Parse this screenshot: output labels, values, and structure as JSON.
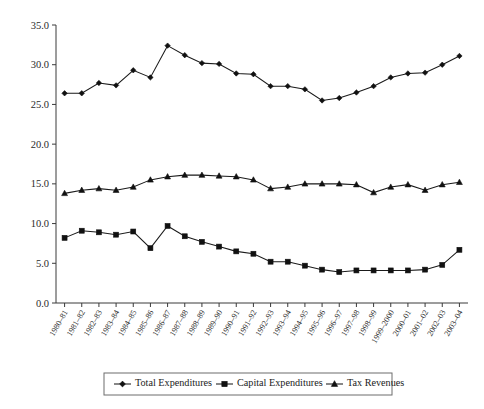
{
  "chart_data": {
    "type": "line",
    "title": "",
    "subtitle": "",
    "xlabel": "",
    "ylabel": "",
    "ylim": [
      0.0,
      35.0
    ],
    "yticks": [
      "0.0",
      "5.0",
      "10.0",
      "15.0",
      "20.0",
      "25.0",
      "30.0",
      "35.0"
    ],
    "ytick_values": [
      0.0,
      5.0,
      10.0,
      15.0,
      20.0,
      25.0,
      30.0,
      35.0
    ],
    "grid": false,
    "legend_position": "bottom",
    "categories": [
      "1980–81",
      "1981–82",
      "1982–83",
      "1983–84",
      "1984–85",
      "1985–86",
      "1986–87",
      "1987–88",
      "1988–89",
      "1989–90",
      "1990–91",
      "1991–92",
      "1992–93",
      "1993–94",
      "1994–95",
      "1995–96",
      "1996–97",
      "1997–98",
      "1998–99",
      "1999–2000",
      "2000–01",
      "2001–02",
      "2002–03",
      "2003–04"
    ],
    "series": [
      {
        "name": "Total Expenditures",
        "marker": "diamond",
        "values": [
          26.4,
          26.4,
          27.7,
          27.4,
          29.3,
          28.4,
          32.4,
          31.2,
          30.2,
          30.1,
          28.9,
          28.8,
          27.3,
          27.3,
          26.9,
          25.5,
          25.8,
          26.5,
          27.3,
          28.4,
          28.9,
          29.0,
          30.0,
          31.1
        ]
      },
      {
        "name": "Capital Expenditures",
        "marker": "square",
        "values": [
          8.2,
          9.1,
          8.9,
          8.6,
          9.0,
          6.9,
          9.7,
          8.4,
          7.7,
          7.1,
          6.5,
          6.2,
          5.2,
          5.2,
          4.7,
          4.2,
          3.9,
          4.1,
          4.1,
          4.1,
          4.1,
          4.2,
          4.8,
          6.7
        ]
      },
      {
        "name": "Tax Revenues",
        "marker": "triangle",
        "values": [
          13.8,
          14.2,
          14.4,
          14.2,
          14.6,
          15.5,
          15.9,
          16.1,
          16.1,
          16.0,
          15.9,
          15.5,
          14.4,
          14.6,
          15.0,
          15.0,
          15.0,
          14.9,
          13.9,
          14.6,
          14.9,
          14.2,
          14.9,
          15.2
        ]
      }
    ]
  },
  "legend": {
    "items": [
      {
        "label": "Total Expenditures",
        "marker": "diamond"
      },
      {
        "label": "Capital Expenditures",
        "marker": "square"
      },
      {
        "label": "Tax Revenues",
        "marker": "triangle"
      }
    ]
  }
}
